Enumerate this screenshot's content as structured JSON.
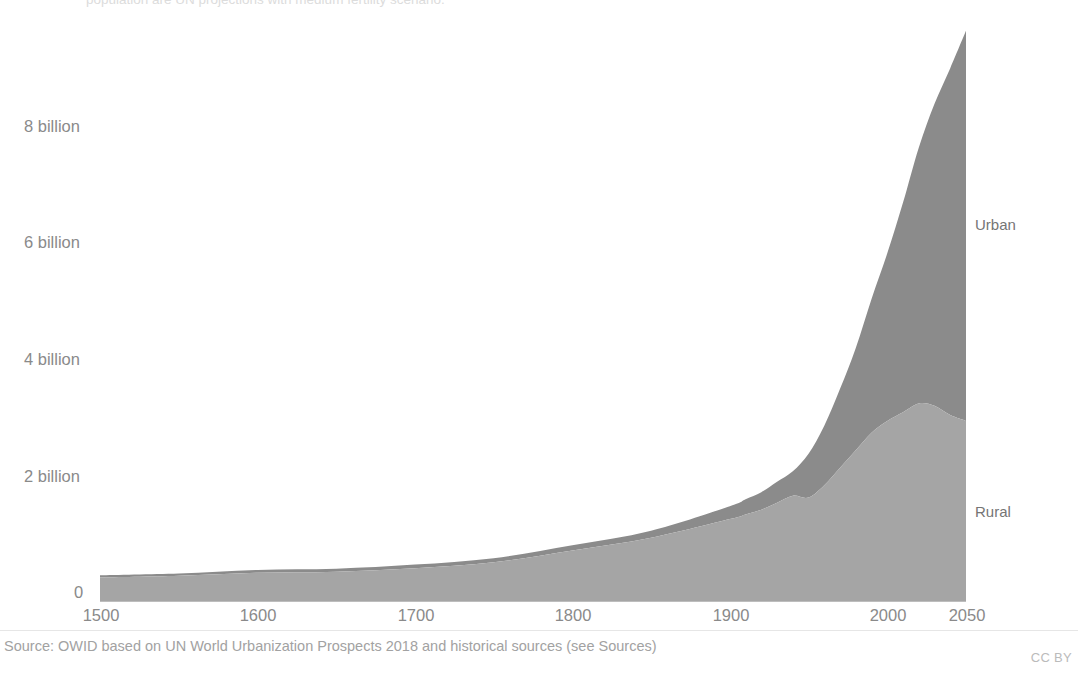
{
  "header": {
    "subtitle_truncated": "population are UN projections with medium fertility scenario."
  },
  "series_labels": {
    "urban": "Urban",
    "rural": "Rural"
  },
  "footer": {
    "source": "Source: OWID based on UN World Urbanization Prospects 2018 and historical sources (see Sources)",
    "license": "CC BY"
  },
  "chart_data": {
    "type": "area",
    "stacked": true,
    "title": "",
    "subtitle": "population are UN projections with medium fertility scenario.",
    "xlabel": "",
    "ylabel": "",
    "xlim": [
      1500,
      2050
    ],
    "ylim": [
      0,
      10
    ],
    "grid": false,
    "legend_position": "direct-labels-right",
    "y_tick_labels": [
      "0",
      "2 billion",
      "4 billion",
      "6 billion",
      "8 billion"
    ],
    "y_tick_values": [
      0,
      2,
      4,
      6,
      8
    ],
    "x_tick_labels": [
      "1500",
      "1600",
      "1700",
      "1800",
      "1900",
      "2000",
      "2050"
    ],
    "x_tick_values": [
      1500,
      1600,
      1700,
      1800,
      1900,
      2000,
      2050
    ],
    "units": "billions of people",
    "colors": {
      "urban": "#8b8b8b",
      "rural": "#a5a5a5",
      "axis": "#bdbdbd",
      "text": "#8a8a8a"
    },
    "x": [
      1500,
      1550,
      1600,
      1650,
      1700,
      1750,
      1800,
      1850,
      1900,
      1910,
      1920,
      1930,
      1940,
      1950,
      1960,
      1970,
      1980,
      1990,
      2000,
      2010,
      2020,
      2030,
      2040,
      2050
    ],
    "series": [
      {
        "name": "Rural",
        "values": [
          0.42,
          0.45,
          0.5,
          0.52,
          0.58,
          0.68,
          0.88,
          1.1,
          1.42,
          1.5,
          1.58,
          1.7,
          1.82,
          1.79,
          2.0,
          2.3,
          2.6,
          2.9,
          3.1,
          3.25,
          3.4,
          3.36,
          3.2,
          3.1
        ],
        "color": "#a5a5a5"
      },
      {
        "name": "Urban",
        "values": [
          0.04,
          0.04,
          0.05,
          0.05,
          0.06,
          0.07,
          0.09,
          0.12,
          0.22,
          0.26,
          0.3,
          0.36,
          0.42,
          0.75,
          1.02,
          1.35,
          1.75,
          2.29,
          2.87,
          3.59,
          4.38,
          5.17,
          5.94,
          6.68
        ],
        "color": "#8b8b8b"
      }
    ],
    "totals": [
      0.46,
      0.49,
      0.55,
      0.57,
      0.64,
      0.75,
      0.97,
      1.22,
      1.64,
      1.76,
      1.88,
      2.06,
      2.24,
      2.54,
      3.02,
      3.65,
      4.35,
      5.19,
      5.97,
      6.84,
      7.78,
      8.53,
      9.14,
      9.78
    ]
  }
}
